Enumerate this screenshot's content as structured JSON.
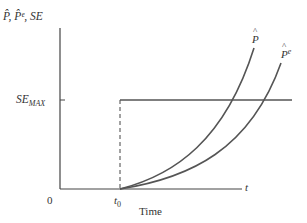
{
  "diagram": {
    "y_axis_label": "P̂, P̂ᵉ, SE",
    "x_axis_label": "Time",
    "x_axis_end_label": "t",
    "origin_label": "0",
    "t0_label": "t",
    "t0_subscript": "0",
    "se_max_label": "SE",
    "se_max_subscript": "MAX",
    "curves": [
      {
        "name": "P̂",
        "label_base": "P",
        "label_hat": "^",
        "label_sup": ""
      },
      {
        "name": "P̂ᵉ",
        "label_base": "P",
        "label_hat": "^",
        "label_sup": "e"
      }
    ],
    "colors": {
      "axis": "#444444",
      "curve": "#555555",
      "text": "#333333"
    }
  }
}
